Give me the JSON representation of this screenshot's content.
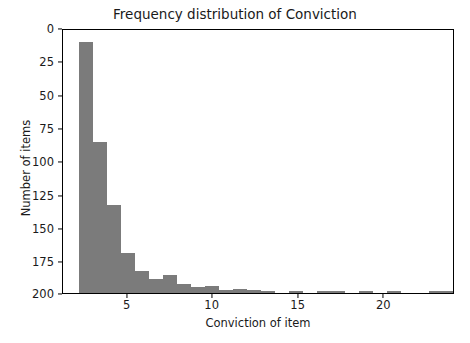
{
  "chart_data": {
    "type": "bar",
    "subtype": "histogram",
    "title": "Frequency distribution of Conviction",
    "xlabel": "Conviction of item",
    "ylabel": "Number of items",
    "bar_color": "#7b7b7b",
    "grid": false,
    "legend": null,
    "xlim": [
      1.22,
      24.15
    ],
    "ylim": [
      0,
      208
    ],
    "xticks": [
      5,
      10,
      15,
      20
    ],
    "xtick_labels": [
      "5",
      "10",
      "15",
      "20"
    ],
    "yticks": [
      0,
      25,
      50,
      75,
      100,
      125,
      150,
      175,
      200
    ],
    "ytick_labels": [
      "0",
      "25",
      "50",
      "75",
      "100",
      "125",
      "150",
      "175",
      "200"
    ],
    "bin_start": 2.15,
    "bin_width": 0.82,
    "bin_edges": [
      2.15,
      2.97,
      3.79,
      4.61,
      5.43,
      6.25,
      7.07,
      7.89,
      8.71,
      9.53,
      10.35,
      11.17,
      11.99,
      12.81,
      13.63,
      14.45,
      15.27,
      16.09,
      16.91,
      17.73,
      18.55,
      19.37,
      20.19,
      21.01,
      21.83,
      22.65,
      23.47,
      24.29
    ],
    "values": [
      198,
      119,
      69,
      31,
      17,
      11,
      14,
      7,
      4,
      5,
      2,
      3,
      2,
      1,
      0,
      1,
      0,
      1,
      1,
      0,
      1,
      0,
      1,
      0,
      0,
      1,
      1
    ],
    "bars_px": [
      {
        "left": 16.0,
        "width": 14.0,
        "height": 250.5
      },
      {
        "left": 30.0,
        "width": 14.0,
        "height": 150.5
      },
      {
        "left": 44.0,
        "width": 14.0,
        "height": 87.3
      },
      {
        "left": 58.0,
        "width": 14.0,
        "height": 39.2
      },
      {
        "left": 72.0,
        "width": 14.0,
        "height": 21.5
      },
      {
        "left": 86.0,
        "width": 14.0,
        "height": 13.9
      },
      {
        "left": 100.0,
        "width": 14.0,
        "height": 17.7
      },
      {
        "left": 114.0,
        "width": 14.0,
        "height": 8.9
      },
      {
        "left": 128.0,
        "width": 14.0,
        "height": 5.1
      },
      {
        "left": 142.0,
        "width": 14.0,
        "height": 6.3
      },
      {
        "left": 156.0,
        "width": 14.0,
        "height": 2.5
      },
      {
        "left": 170.0,
        "width": 14.0,
        "height": 3.8
      },
      {
        "left": 184.0,
        "width": 14.0,
        "height": 2.5
      },
      {
        "left": 198.0,
        "width": 14.0,
        "height": 1.3
      },
      {
        "left": 212.0,
        "width": 14.0,
        "height": 0.0
      },
      {
        "left": 226.0,
        "width": 14.0,
        "height": 1.3
      },
      {
        "left": 240.0,
        "width": 14.0,
        "height": 0.0
      },
      {
        "left": 254.0,
        "width": 14.0,
        "height": 1.3
      },
      {
        "left": 268.0,
        "width": 14.0,
        "height": 1.3
      },
      {
        "left": 282.0,
        "width": 14.0,
        "height": 0.0
      },
      {
        "left": 296.0,
        "width": 14.0,
        "height": 1.3
      },
      {
        "left": 310.0,
        "width": 14.0,
        "height": 0.0
      },
      {
        "left": 324.0,
        "width": 14.0,
        "height": 1.3
      },
      {
        "left": 338.0,
        "width": 14.0,
        "height": 0.0
      },
      {
        "left": 352.0,
        "width": 14.0,
        "height": 0.0
      },
      {
        "left": 366.0,
        "width": 14.0,
        "height": 1.3
      },
      {
        "left": 380.0,
        "width": 14.0,
        "height": 1.3
      }
    ],
    "ytick_px": [
      264.5,
      231.1,
      197.8,
      164.5,
      131.1,
      97.8,
      64.4,
      31.1,
      0.0
    ],
    "xtick_px": [
      64.7,
      149.7,
      235.7,
      321.3
    ]
  }
}
